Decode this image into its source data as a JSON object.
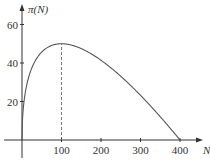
{
  "chart_data": {
    "type": "line",
    "title": "",
    "xlabel": "N",
    "ylabel": "π(N)",
    "xlim": [
      0,
      420
    ],
    "ylim": [
      0,
      65
    ],
    "x_ticks": [
      100,
      200,
      300,
      400
    ],
    "x_tick_labels": [
      "100",
      "200",
      "300",
      "400"
    ],
    "y_ticks": [
      20,
      40,
      60
    ],
    "y_tick_labels": [
      "20",
      "40",
      "60"
    ],
    "grid": false,
    "legend": "none",
    "series": [
      {
        "name": "π(N)",
        "formula": "10*sqrt(N) - N/2",
        "x": [
          0,
          5,
          10,
          25,
          50,
          75,
          100,
          150,
          200,
          250,
          300,
          350,
          400
        ],
        "y": [
          0,
          19.9,
          26.6,
          37.5,
          45.7,
          49.1,
          50.0,
          47.5,
          41.4,
          33.1,
          23.2,
          12.1,
          0
        ]
      }
    ],
    "annotations": [
      {
        "type": "dashed-vertical-line",
        "x": 100,
        "from_y": 0,
        "to_y": 50,
        "label": "peak"
      }
    ],
    "colors": {
      "curve": "#555555",
      "axis": "#333333",
      "text": "#333333"
    }
  }
}
